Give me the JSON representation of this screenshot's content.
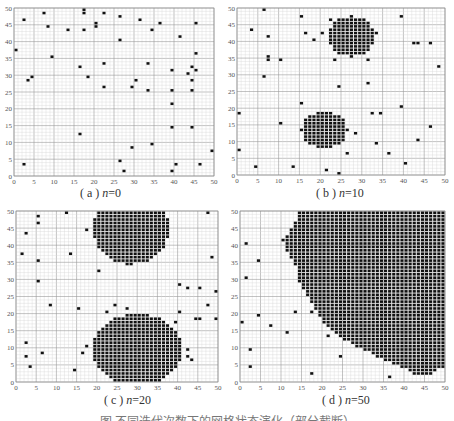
{
  "figure": {
    "bottom_caption_visible": "图  不同迭代次数下的网格状态演化（部分截断）"
  },
  "chart_data": [
    {
      "type": "scatter",
      "id": "a",
      "title": "(a) n=0",
      "caption_prefix": "( a ) ",
      "caption_var": "n",
      "caption_value": "=0",
      "xlim": [
        0,
        50
      ],
      "ylim": [
        0,
        50
      ],
      "xticks": [
        0,
        5,
        10,
        15,
        20,
        25,
        30,
        35,
        40,
        45,
        50
      ],
      "yticks": [
        0,
        5,
        10,
        15,
        20,
        25,
        30,
        35,
        40,
        45,
        50
      ],
      "grid": true,
      "minor_grid_step": 1,
      "major_grid_step": 5,
      "box": {
        "x": 14,
        "y": 8,
        "w": 200,
        "h": 168
      },
      "caption_pos": {
        "x": 80,
        "y": 186
      },
      "points": [
        [
          0,
          37
        ],
        [
          2,
          46
        ],
        [
          2,
          3
        ],
        [
          3,
          28
        ],
        [
          4,
          29
        ],
        [
          7,
          48
        ],
        [
          8,
          44
        ],
        [
          9,
          35
        ],
        [
          13,
          43
        ],
        [
          16,
          32
        ],
        [
          16,
          12
        ],
        [
          17,
          49
        ],
        [
          17,
          48
        ],
        [
          17,
          43
        ],
        [
          18,
          29
        ],
        [
          20,
          45
        ],
        [
          20,
          44
        ],
        [
          22,
          48
        ],
        [
          22,
          33
        ],
        [
          22,
          26
        ],
        [
          26,
          47
        ],
        [
          26,
          40
        ],
        [
          26,
          4
        ],
        [
          27,
          1
        ],
        [
          29,
          26
        ],
        [
          29,
          8
        ],
        [
          30,
          28
        ],
        [
          31,
          46
        ],
        [
          33,
          33
        ],
        [
          33,
          25
        ],
        [
          34,
          43
        ],
        [
          34,
          9
        ],
        [
          36,
          45
        ],
        [
          39,
          31
        ],
        [
          39,
          25
        ],
        [
          39,
          21
        ],
        [
          39,
          14
        ],
        [
          39,
          1
        ],
        [
          40,
          3
        ],
        [
          41,
          41
        ],
        [
          43,
          30
        ],
        [
          44,
          32
        ],
        [
          44,
          28
        ],
        [
          44,
          25
        ],
        [
          44,
          14
        ],
        [
          45,
          45
        ],
        [
          45,
          36
        ],
        [
          45,
          31
        ],
        [
          46,
          3
        ],
        [
          49,
          7
        ]
      ],
      "clusters": [],
      "fill_region": null
    },
    {
      "type": "scatter",
      "id": "b",
      "title": "(b) n=10",
      "caption_prefix": "( b ) ",
      "caption_var": "n",
      "caption_value": "=10",
      "xlim": [
        0,
        50
      ],
      "ylim": [
        0,
        50
      ],
      "xticks": [
        0,
        5,
        10,
        15,
        20,
        25,
        30,
        35,
        40,
        45,
        50
      ],
      "yticks": [
        0,
        5,
        10,
        15,
        20,
        25,
        30,
        35,
        40,
        45,
        50
      ],
      "grid": true,
      "minor_grid_step": 1,
      "major_grid_step": 5,
      "box": {
        "x": 237,
        "y": 8,
        "w": 208,
        "h": 167
      },
      "caption_pos": {
        "x": 316,
        "y": 186
      },
      "points": [
        [
          0,
          18
        ],
        [
          0,
          7
        ],
        [
          3,
          43
        ],
        [
          4,
          2
        ],
        [
          6,
          49
        ],
        [
          6,
          29
        ],
        [
          7,
          41
        ],
        [
          7,
          35
        ],
        [
          7,
          34
        ],
        [
          10,
          34
        ],
        [
          10,
          15
        ],
        [
          13,
          2
        ],
        [
          15,
          47
        ],
        [
          15,
          21
        ],
        [
          16,
          42
        ],
        [
          18,
          40
        ],
        [
          20,
          42
        ],
        [
          21,
          1
        ],
        [
          22,
          46
        ],
        [
          22,
          42
        ],
        [
          23,
          34
        ],
        [
          24,
          26
        ],
        [
          24,
          0
        ],
        [
          26,
          6
        ],
        [
          28,
          12
        ],
        [
          31,
          34
        ],
        [
          31,
          27
        ],
        [
          32,
          18
        ],
        [
          33,
          42
        ],
        [
          33,
          9
        ],
        [
          34,
          18
        ],
        [
          36,
          6
        ],
        [
          39,
          47
        ],
        [
          39,
          20
        ],
        [
          40,
          3
        ],
        [
          42,
          39
        ],
        [
          43,
          39
        ],
        [
          43,
          10
        ],
        [
          46,
          39
        ],
        [
          46,
          14
        ],
        [
          48,
          32
        ]
      ],
      "clusters": [
        {
          "cx": 27.5,
          "cy": 41.5,
          "rx": 5.5,
          "ry": 6
        },
        {
          "cx": 21,
          "cy": 13.5,
          "rx": 5.5,
          "ry": 5.5
        }
      ],
      "fill_region": null
    },
    {
      "type": "scatter",
      "id": "c",
      "title": "(c) n=20",
      "caption_prefix": "( c ) ",
      "caption_var": "n",
      "caption_value": "=20",
      "xlim": [
        0,
        50
      ],
      "ylim": [
        0,
        50
      ],
      "xticks": [
        0,
        5,
        10,
        15,
        20,
        25,
        30,
        35,
        40,
        45,
        50
      ],
      "yticks": [
        0,
        5,
        10,
        15,
        20,
        25,
        30,
        35,
        40,
        45,
        50
      ],
      "grid": true,
      "minor_grid_step": 1,
      "major_grid_step": 5,
      "box": {
        "x": 16,
        "y": 211,
        "w": 202,
        "h": 171
      },
      "caption_pos": {
        "x": 104,
        "y": 393
      },
      "points": [
        [
          1,
          37
        ],
        [
          2,
          43
        ],
        [
          2,
          11
        ],
        [
          2,
          7
        ],
        [
          3,
          4
        ],
        [
          5,
          48
        ],
        [
          5,
          46
        ],
        [
          5,
          35
        ],
        [
          5,
          29
        ],
        [
          6,
          8
        ],
        [
          8,
          22
        ],
        [
          12,
          49
        ],
        [
          13,
          37
        ],
        [
          14,
          3
        ],
        [
          15,
          21
        ],
        [
          16,
          8
        ],
        [
          17,
          10
        ],
        [
          17,
          44
        ],
        [
          20,
          32
        ],
        [
          22,
          20
        ],
        [
          24,
          22
        ],
        [
          27,
          21
        ],
        [
          27,
          34
        ],
        [
          35,
          0
        ],
        [
          39,
          17
        ],
        [
          40,
          28
        ],
        [
          40,
          20
        ],
        [
          42,
          27
        ],
        [
          42,
          9
        ],
        [
          42,
          7
        ],
        [
          43,
          6
        ],
        [
          44,
          18
        ],
        [
          45,
          27
        ],
        [
          45,
          18
        ],
        [
          47,
          49
        ],
        [
          47,
          22
        ],
        [
          48,
          36
        ],
        [
          49,
          26
        ],
        [
          49,
          18
        ]
      ],
      "clusters": [
        {
          "cx": 28.5,
          "cy": 45,
          "rx": 9.5,
          "ry": 10.5
        },
        {
          "cx": 30,
          "cy": 9.5,
          "rx": 11,
          "ry": 10.5
        }
      ],
      "fill_region": null
    },
    {
      "type": "scatter",
      "id": "d",
      "title": "(d) n=50",
      "caption_prefix": "( d ) ",
      "caption_var": "n",
      "caption_value": "=50",
      "xlim": [
        0,
        50
      ],
      "ylim": [
        0,
        50
      ],
      "xticks": [
        0,
        5,
        10,
        15,
        20,
        25,
        30,
        35,
        40,
        45,
        50
      ],
      "yticks": [
        0,
        5,
        10,
        15,
        20,
        25,
        30,
        35,
        40,
        45,
        50
      ],
      "grid": true,
      "minor_grid_step": 1,
      "major_grid_step": 5,
      "box": {
        "x": 240,
        "y": 211,
        "w": 205,
        "h": 171
      },
      "caption_pos": {
        "x": 322,
        "y": 393
      },
      "points": [
        [
          1,
          40
        ],
        [
          1,
          30
        ],
        [
          0,
          17
        ],
        [
          2,
          9
        ],
        [
          2,
          4
        ],
        [
          4,
          35
        ],
        [
          4,
          19
        ],
        [
          7,
          16
        ],
        [
          10,
          41
        ],
        [
          11,
          14
        ],
        [
          13,
          20
        ],
        [
          17,
          20
        ],
        [
          17,
          2
        ],
        [
          21,
          13
        ],
        [
          24,
          7
        ],
        [
          36,
          1
        ]
      ],
      "clusters": [],
      "fill_region": [
        [
          14,
          50
        ],
        [
          50,
          50
        ],
        [
          50,
          4
        ],
        [
          49,
          4
        ],
        [
          48,
          3
        ],
        [
          46,
          2
        ],
        [
          43,
          2
        ],
        [
          42,
          3
        ],
        [
          40,
          4
        ],
        [
          38,
          5
        ],
        [
          36,
          6
        ],
        [
          34,
          7
        ],
        [
          33,
          8
        ],
        [
          31,
          9
        ],
        [
          29,
          10
        ],
        [
          28,
          11
        ],
        [
          26,
          12
        ],
        [
          25,
          13
        ],
        [
          24,
          14
        ],
        [
          22,
          16
        ],
        [
          21,
          17
        ],
        [
          20,
          18
        ],
        [
          19,
          20
        ],
        [
          18,
          22
        ],
        [
          17,
          24
        ],
        [
          16,
          26
        ],
        [
          15,
          28
        ],
        [
          14,
          30
        ],
        [
          14,
          33
        ],
        [
          13,
          35
        ],
        [
          12,
          37
        ],
        [
          11,
          39
        ],
        [
          11,
          41
        ],
        [
          12,
          44
        ],
        [
          13,
          46
        ],
        [
          14,
          48
        ]
      ]
    }
  ]
}
